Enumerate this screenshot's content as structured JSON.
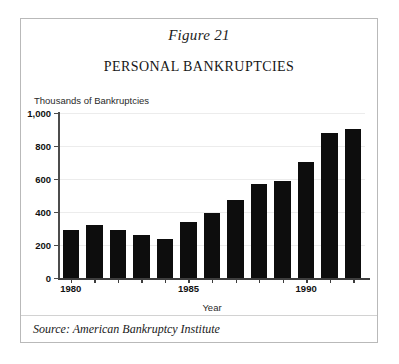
{
  "figure": {
    "number_label": "Figure 21",
    "title": "PERSONAL BANKRUPTCIES",
    "source_note": "Source: American Bankruptcy Institute",
    "frame_border_color": "#b9b9b9",
    "background_color": "#ffffff"
  },
  "chart_data": {
    "type": "bar",
    "title": "PERSONAL BANKRUPTCIES",
    "subtitle": "Figure 21",
    "xlabel": "Year",
    "ylabel": "Thousands of Bankruptcies",
    "ylim": [
      0,
      1000
    ],
    "ytick_values": [
      0,
      200,
      400,
      600,
      800,
      1000
    ],
    "ytick_labels": [
      "0",
      "200",
      "400",
      "600",
      "800",
      "1,000"
    ],
    "categories": [
      "1980",
      "1981",
      "1982",
      "1983",
      "1984",
      "1985",
      "1986",
      "1987",
      "1988",
      "1989",
      "1990",
      "1991",
      "1992"
    ],
    "xtick_labels": [
      "1980",
      "1985",
      "1990"
    ],
    "xtick_categories": [
      "1980",
      "1985",
      "1990"
    ],
    "values": [
      290,
      320,
      288,
      260,
      235,
      340,
      392,
      472,
      570,
      590,
      705,
      878,
      905
    ],
    "series": [
      {
        "name": "Personal bankruptcies",
        "color": "#0d0d0d",
        "values": [
          290,
          320,
          288,
          260,
          235,
          340,
          392,
          472,
          570,
          590,
          705,
          878,
          905
        ]
      }
    ],
    "grid": true,
    "gridline_color": "#ececec",
    "legend": false,
    "bar_color": "#0d0d0d",
    "axis_color": "#3d3d3d",
    "units": "thousands"
  }
}
